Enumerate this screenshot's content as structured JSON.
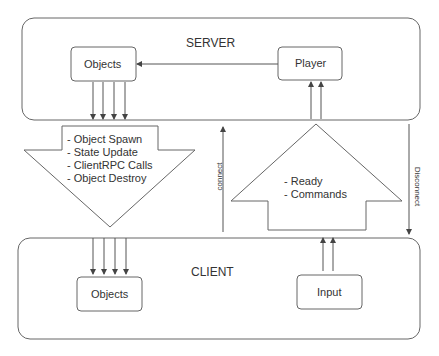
{
  "server": {
    "label": "SERVER",
    "objects_label": "Objects",
    "player_label": "Player"
  },
  "client": {
    "label": "CLIENT",
    "objects_label": "Objects",
    "input_label": "Input"
  },
  "down_arrow": {
    "items": [
      "- Object Spawn",
      "- State Update",
      "- ClientRPC Calls",
      "- Object Destroy"
    ]
  },
  "up_arrow": {
    "items": [
      "- Ready",
      "- Commands"
    ]
  },
  "connect_label": "connect",
  "disconnect_label": "Disconnect",
  "colors": {
    "stroke": "#555555",
    "text": "#333333",
    "background": "#ffffff"
  }
}
